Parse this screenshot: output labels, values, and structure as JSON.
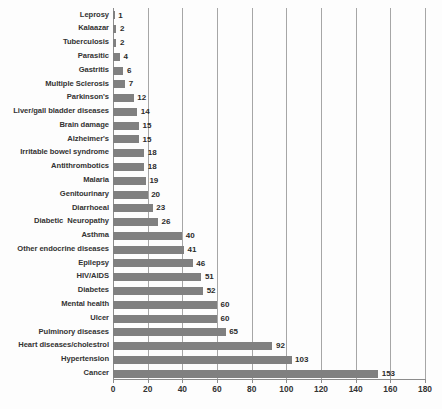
{
  "chart_data": {
    "type": "bar",
    "orientation": "horizontal",
    "title": "",
    "subtitle": "",
    "xlabel": "",
    "ylabel": "",
    "xlim": [
      0,
      180
    ],
    "xticks": [
      0,
      20,
      40,
      60,
      80,
      100,
      120,
      140,
      160,
      180
    ],
    "grid": "vertical",
    "legend": "none",
    "bar_color": "#808080",
    "categories": [
      "Leprosy",
      "Kalaazar",
      "Tuberculosis",
      "Parasitic",
      "Gastritis",
      "Multiple Sclerosis",
      "Parkinson's",
      "Liver/gall bladder diseases",
      "Brain damage",
      "Alzheimer's",
      "Irritable bowel syndrome",
      "Antithrombotics",
      "Malaria",
      "Genitourinary",
      "Diarrhoeal",
      "Diabetic  Neuropathy",
      "Asthma",
      "Other endocrine diseases",
      "Epilepsy",
      "HIV/AIDS",
      "Diabetes",
      "Mental health",
      "Ulcer",
      "Pulminory diseases",
      "Heart diseases/cholestrol",
      "Hypertension",
      "Cancer"
    ],
    "values": [
      1,
      2,
      2,
      4,
      6,
      7,
      12,
      14,
      15,
      15,
      18,
      18,
      19,
      20,
      23,
      26,
      40,
      41,
      46,
      51,
      52,
      60,
      60,
      65,
      92,
      103,
      153
    ],
    "data_labels": [
      "1",
      "2",
      "2",
      "4",
      "6",
      "7",
      "12",
      "14",
      "15",
      "15",
      "18",
      "18",
      "19",
      "20",
      "23",
      "26",
      "40",
      "41",
      "46",
      "51",
      "52",
      "60",
      "60",
      "65",
      "92",
      "103",
      "153"
    ]
  }
}
